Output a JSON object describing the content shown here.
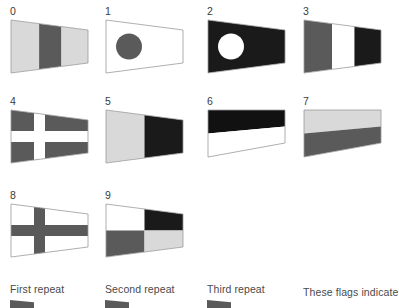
{
  "page": {
    "background_color": "#ffffff",
    "width": 399,
    "height": 306
  },
  "palette": {
    "light_gray": "#d9d9d9",
    "mid_gray": "#5a5a5a",
    "dark_gray": "#4d4d4d",
    "black": "#111111",
    "white": "#ffffff",
    "outline": "#9a9a9a",
    "text": "#3b3b3b",
    "caption_text": "#4a4a4a"
  },
  "flags": [
    {
      "number": "0",
      "name": "pennant-zero",
      "x": 10,
      "y": 6,
      "shape": "pennant",
      "description": "Three vertical bands: light gray, dark gray, light gray",
      "bands": [
        "#d9d9d9",
        "#5a5a5a",
        "#d9d9d9"
      ]
    },
    {
      "number": "1",
      "name": "pennant-one",
      "x": 105,
      "y": 6,
      "shape": "pennant",
      "description": "White field with a dark gray disc near the hoist",
      "bands": [
        "#ffffff"
      ],
      "disc": "#5a5a5a"
    },
    {
      "number": "2",
      "name": "pennant-two",
      "x": 207,
      "y": 6,
      "shape": "pennant",
      "description": "Black field with a white disc near the hoist",
      "bands": [
        "#1a1a1a"
      ],
      "disc": "#ffffff"
    },
    {
      "number": "3",
      "name": "pennant-three",
      "x": 303,
      "y": 6,
      "shape": "pennant",
      "description": "Three vertical bands: dark gray, white, black",
      "bands": [
        "#5a5a5a",
        "#ffffff",
        "#1a1a1a"
      ]
    },
    {
      "number": "4",
      "name": "pennant-four",
      "x": 10,
      "y": 96,
      "shape": "pennant",
      "description": "Dark gray field with a white cross toward the hoist",
      "bands": [
        "#5a5a5a"
      ],
      "cross": "#ffffff"
    },
    {
      "number": "5",
      "name": "pennant-five",
      "x": 105,
      "y": 96,
      "shape": "pennant",
      "description": "Two vertical bands: light gray at hoist, black at fly",
      "bands": [
        "#d9d9d9",
        "#1a1a1a"
      ]
    },
    {
      "number": "6",
      "name": "pennant-six",
      "x": 207,
      "y": 96,
      "shape": "taper-down",
      "description": "Horizontal halves: black over white, tapering trapezoid",
      "bands": [
        "#111111",
        "#ffffff"
      ]
    },
    {
      "number": "7",
      "name": "pennant-seven",
      "x": 303,
      "y": 96,
      "shape": "taper-down",
      "description": "Horizontal halves: light gray over dark gray, tapering trapezoid",
      "bands": [
        "#d9d9d9",
        "#5a5a5a"
      ]
    },
    {
      "number": "8",
      "name": "pennant-eight",
      "x": 10,
      "y": 190,
      "shape": "pennant",
      "description": "White field with a dark gray cross toward the hoist",
      "bands": [
        "#ffffff"
      ],
      "cross": "#5a5a5a"
    },
    {
      "number": "9",
      "name": "pennant-nine",
      "x": 105,
      "y": 190,
      "shape": "pennant",
      "description": "Quartered: white, black, dark gray, light gray",
      "bands": [
        "#ffffff",
        "#1a1a1a",
        "#5a5a5a",
        "#d9d9d9"
      ]
    }
  ],
  "captions": [
    {
      "label": "First repeat",
      "x": 10,
      "y": 283
    },
    {
      "label": "Second repeat",
      "x": 105,
      "y": 283
    },
    {
      "label": "Third repeat",
      "x": 207,
      "y": 283
    },
    {
      "label": "These flags indicate",
      "x": 303,
      "y": 286
    }
  ],
  "caption_stubs": [
    {
      "name": "repeat-pennant-stub-first",
      "x": 10,
      "y": 300
    },
    {
      "name": "repeat-pennant-stub-second",
      "x": 105,
      "y": 300
    },
    {
      "name": "repeat-pennant-stub-third",
      "x": 207,
      "y": 300
    }
  ]
}
